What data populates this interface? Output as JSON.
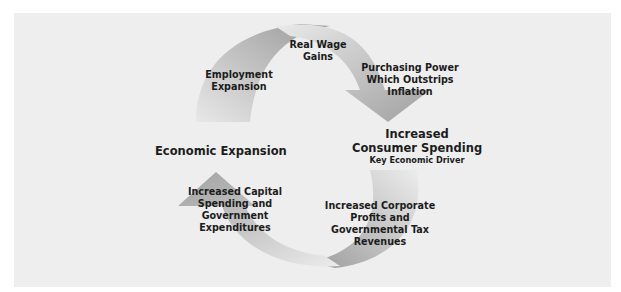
{
  "diagram": {
    "type": "cycle",
    "colors": {
      "panel_bg": "#eeeeee",
      "arrow_dark": "#9a9a9a",
      "arrow_light": "#e6e6e6",
      "text": "#1c1c1c"
    },
    "left_node": {
      "label": "Economic Expansion"
    },
    "right_node": {
      "line1": "Increased",
      "line2": "Consumer Spending",
      "sub": "Key Economic Driver"
    },
    "steps": {
      "employment": {
        "line1": "Employment",
        "line2": "Expansion"
      },
      "wages": {
        "line1": "Real Wage",
        "line2": "Gains"
      },
      "purchasing": {
        "line1": "Purchasing Power",
        "line2": "Which Outstrips",
        "line3": "Inflation"
      },
      "corporate": {
        "line1": "Increased Corporate",
        "line2": "Profits and",
        "line3": "Governmental Tax",
        "line4": "Revenues"
      },
      "capital": {
        "line1": "Increased Capital",
        "line2": "Spending and",
        "line3": "Government",
        "line4": "Expenditures"
      }
    }
  }
}
